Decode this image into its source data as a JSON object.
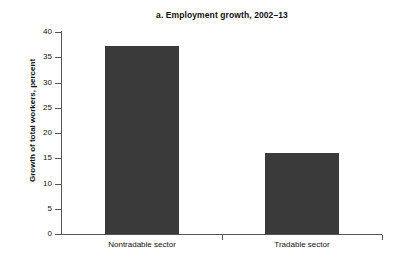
{
  "chart_data": {
    "type": "bar",
    "title": "a. Employment growth, 2002–13",
    "xlabel": "",
    "ylabel": "Growth of total workers, percent",
    "categories": [
      "Nontradable sector",
      "Tradable sector"
    ],
    "values": [
      37.2,
      16.0
    ],
    "series": [
      {
        "name": "Growth of total workers",
        "values": [
          37.2,
          16.0
        ]
      }
    ],
    "ylim": [
      0,
      40
    ],
    "yticks": [
      0,
      5,
      10,
      15,
      20,
      25,
      30,
      35,
      40
    ],
    "ytick_labels": [
      "0",
      "5",
      "10",
      "15",
      "20",
      "25",
      "30",
      "35",
      "40"
    ],
    "grid": false,
    "legend": "none",
    "bar_color": "#3a3a3a",
    "axis_color": "#555555",
    "text_color": "#111111",
    "background": "#ffffff"
  }
}
